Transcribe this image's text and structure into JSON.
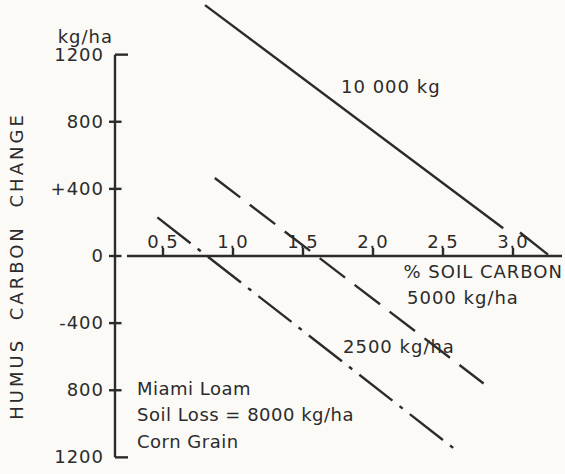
{
  "figure_labels": {
    "y_unit": "kg/ha",
    "y_axis_title": "HUMUS CARBON CHANGE",
    "x_axis_title": "% SOIL CARBON",
    "solid_line_label": "10 000 kg",
    "dashed_line_label": "5000 kg/ha",
    "dashdot_line_label": "2500 kg/ha",
    "annotation_line1": "Miami Loam",
    "annotation_line2": "Soil Loss = 8000 kg/ha",
    "annotation_line3": "Corn Grain"
  },
  "axis_ticks": {
    "y": [
      {
        "label": "1200",
        "value": 1200
      },
      {
        "label": "800",
        "value": 800
      },
      {
        "label": "+400",
        "value": 400
      },
      {
        "label": "0",
        "value": 0
      },
      {
        "label": "-400",
        "value": -400
      },
      {
        "label": "800",
        "value": -800
      },
      {
        "label": "1200",
        "value": -1200
      }
    ],
    "x": [
      {
        "label": "0.5",
        "value": 0.5
      },
      {
        "label": "1.0",
        "value": 1.0
      },
      {
        "label": "1.5",
        "value": 1.5
      },
      {
        "label": "2.0",
        "value": 2.0
      },
      {
        "label": "2.5",
        "value": 2.5
      },
      {
        "label": "3.0",
        "value": 3.0
      }
    ]
  },
  "chart_data": {
    "type": "line",
    "title": "",
    "xlabel": "% SOIL CARBON",
    "ylabel": "HUMUS CARBON CHANGE (kg/ha)",
    "xlim": [
      0.3,
      3.3
    ],
    "ylim": [
      -1200,
      1500
    ],
    "x_ticks": [
      0.5,
      1.0,
      1.5,
      2.0,
      2.5,
      3.0
    ],
    "y_ticks": [
      -1200,
      -800,
      -400,
      0,
      400,
      800,
      1200
    ],
    "grid": false,
    "legend_position": "inline-labels",
    "series": [
      {
        "name": "10 000 kg",
        "style": "solid",
        "points": [
          [
            0.8,
            1495
          ],
          [
            3.25,
            8
          ]
        ],
        "segments": [
          [
            [
              0.8,
              1495
            ],
            [
              2.93,
              165
            ]
          ],
          [
            [
              3.05,
              140
            ],
            [
              3.25,
              8
            ]
          ]
        ]
      },
      {
        "name": "5000 kg/ha",
        "style": "dashed",
        "points": [
          [
            0.87,
            465
          ],
          [
            2.79,
            -760
          ]
        ],
        "segments": [
          [
            [
              0.87,
              465
            ],
            [
              2.79,
              -760
            ]
          ]
        ]
      },
      {
        "name": "2500 kg/ha",
        "style": "dash-dot",
        "points": [
          [
            0.46,
            230
          ],
          [
            2.59,
            -1155
          ]
        ],
        "segments": [
          [
            [
              0.46,
              230
            ],
            [
              2.59,
              -1155
            ]
          ]
        ]
      }
    ],
    "annotations": [
      "Miami Loam",
      "Soil Loss = 8000 kg/ha",
      "Corn Grain"
    ]
  },
  "colors": {
    "ink": "#2b2b2b",
    "paper": "#fbfaf7"
  }
}
